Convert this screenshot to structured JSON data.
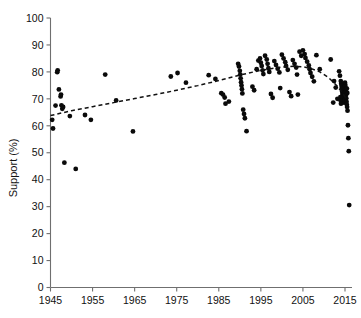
{
  "chart_data": {
    "type": "scatter",
    "title": "",
    "xlabel": "",
    "ylabel": "Support (%)",
    "xlim": [
      1945,
      2017
    ],
    "ylim": [
      0,
      100
    ],
    "grid": false,
    "legend": null,
    "xticks": [
      1945,
      1955,
      1965,
      1975,
      1985,
      1995,
      2005,
      2015
    ],
    "yticks": [
      0,
      10,
      20,
      30,
      40,
      50,
      60,
      70,
      80,
      90,
      100
    ],
    "series": [
      {
        "name": "Survey results",
        "type": "scatter",
        "marker": "filled-circle",
        "color": "#0a0a0a",
        "points": [
          [
            1945.4,
            62.2
          ],
          [
            1945.6,
            59.0
          ],
          [
            1946.2,
            67.5
          ],
          [
            1946.6,
            79.9
          ],
          [
            1946.7,
            80.6
          ],
          [
            1947.0,
            73.5
          ],
          [
            1947.4,
            70.9
          ],
          [
            1947.5,
            71.6
          ],
          [
            1947.6,
            67.6
          ],
          [
            1947.8,
            66.3
          ],
          [
            1948.0,
            67.0
          ],
          [
            1948.3,
            46.3
          ],
          [
            1949.6,
            63.6
          ],
          [
            1951.0,
            44.0
          ],
          [
            1953.2,
            64.0
          ],
          [
            1954.6,
            62.2
          ],
          [
            1958.0,
            79.0
          ],
          [
            1960.6,
            69.4
          ],
          [
            1964.6,
            57.9
          ],
          [
            1973.6,
            78.3
          ],
          [
            1975.2,
            79.6
          ],
          [
            1977.2,
            76.0
          ],
          [
            1982.6,
            78.8
          ],
          [
            1984.2,
            77.4
          ],
          [
            1985.6,
            72.1
          ],
          [
            1986.0,
            71.6
          ],
          [
            1986.4,
            70.5
          ],
          [
            1986.6,
            68.2
          ],
          [
            1987.4,
            69.0
          ],
          [
            1989.6,
            83.0
          ],
          [
            1989.8,
            82.0
          ],
          [
            1990.0,
            80.4
          ],
          [
            1990.1,
            79.0
          ],
          [
            1990.2,
            77.6
          ],
          [
            1990.3,
            76.2
          ],
          [
            1990.4,
            75.0
          ],
          [
            1990.5,
            73.6
          ],
          [
            1990.6,
            72.0
          ],
          [
            1990.8,
            66.0
          ],
          [
            1991.0,
            64.4
          ],
          [
            1991.2,
            62.8
          ],
          [
            1991.6,
            58.0
          ],
          [
            1993.0,
            74.5
          ],
          [
            1993.4,
            73.2
          ],
          [
            1994.0,
            81.0
          ],
          [
            1994.4,
            84.2
          ],
          [
            1994.8,
            85.0
          ],
          [
            1995.0,
            83.4
          ],
          [
            1995.2,
            82.2
          ],
          [
            1995.4,
            80.6
          ],
          [
            1995.6,
            79.2
          ],
          [
            1996.0,
            86.0
          ],
          [
            1996.4,
            84.6
          ],
          [
            1996.6,
            83.0
          ],
          [
            1996.8,
            81.4
          ],
          [
            1997.0,
            80.0
          ],
          [
            1997.4,
            71.8
          ],
          [
            1997.8,
            70.4
          ],
          [
            1998.2,
            84.0
          ],
          [
            1998.6,
            82.6
          ],
          [
            1999.0,
            81.2
          ],
          [
            1999.4,
            79.8
          ],
          [
            1999.6,
            74.0
          ],
          [
            2000.0,
            86.4
          ],
          [
            2000.4,
            85.0
          ],
          [
            2000.8,
            83.6
          ],
          [
            2001.0,
            82.2
          ],
          [
            2001.4,
            80.8
          ],
          [
            2001.8,
            72.5
          ],
          [
            2002.2,
            71.0
          ],
          [
            2002.6,
            84.4
          ],
          [
            2003.0,
            83.0
          ],
          [
            2003.4,
            81.6
          ],
          [
            2003.6,
            79.0
          ],
          [
            2003.8,
            71.6
          ],
          [
            2004.2,
            87.5
          ],
          [
            2004.6,
            86.0
          ],
          [
            2005.0,
            88.0
          ],
          [
            2005.4,
            86.6
          ],
          [
            2005.6,
            85.2
          ],
          [
            2006.0,
            83.8
          ],
          [
            2006.4,
            82.4
          ],
          [
            2006.6,
            81.0
          ],
          [
            2006.8,
            79.6
          ],
          [
            2007.2,
            78.2
          ],
          [
            2007.6,
            76.5
          ],
          [
            2008.2,
            86.2
          ],
          [
            2009.0,
            81.0
          ],
          [
            2011.6,
            84.6
          ],
          [
            2012.4,
            76.6
          ],
          [
            2012.8,
            74.2
          ],
          [
            2013.6,
            80.2
          ],
          [
            2013.8,
            78.6
          ],
          [
            2014.0,
            76.6
          ],
          [
            2014.1,
            75.6
          ],
          [
            2014.2,
            74.8
          ],
          [
            2014.25,
            74.0
          ],
          [
            2014.3,
            73.4
          ],
          [
            2014.35,
            72.8
          ],
          [
            2014.4,
            72.2
          ],
          [
            2014.45,
            71.6
          ],
          [
            2014.5,
            71.0
          ],
          [
            2014.55,
            70.4
          ],
          [
            2014.6,
            69.8
          ],
          [
            2014.65,
            69.2
          ],
          [
            2014.7,
            68.6
          ],
          [
            2014.75,
            73.0
          ],
          [
            2014.8,
            72.4
          ],
          [
            2014.85,
            71.8
          ],
          [
            2014.9,
            70.8
          ],
          [
            2014.95,
            69.6
          ],
          [
            2015.0,
            76.0
          ],
          [
            2015.05,
            75.2
          ],
          [
            2015.1,
            74.4
          ],
          [
            2015.15,
            73.6
          ],
          [
            2015.2,
            72.6
          ],
          [
            2015.25,
            71.4
          ],
          [
            2015.3,
            70.2
          ],
          [
            2015.35,
            69.0
          ],
          [
            2015.4,
            68.0
          ],
          [
            2015.5,
            67.0
          ],
          [
            2013.9,
            70.6
          ],
          [
            2013.95,
            69.4
          ],
          [
            2014.05,
            68.2
          ],
          [
            2015.45,
            73.8
          ],
          [
            2015.55,
            72.2
          ],
          [
            2015.6,
            65.6
          ],
          [
            2015.7,
            60.2
          ],
          [
            2015.8,
            55.4
          ],
          [
            2015.9,
            50.6
          ],
          [
            2016.0,
            30.6
          ],
          [
            2013.2,
            70.0
          ],
          [
            2012.2,
            68.6
          ]
        ]
      }
    ],
    "trend_line": {
      "name": "Fitted trend",
      "style": "dashed",
      "color": "#111111",
      "points": [
        [
          1945.0,
          63.8
        ],
        [
          1950.0,
          65.6
        ],
        [
          1955.0,
          67.1
        ],
        [
          1960.0,
          68.6
        ],
        [
          1965.0,
          70.1
        ],
        [
          1970.0,
          71.6
        ],
        [
          1975.0,
          73.2
        ],
        [
          1980.0,
          74.9
        ],
        [
          1985.0,
          76.8
        ],
        [
          1990.0,
          78.8
        ],
        [
          1995.0,
          80.6
        ],
        [
          2000.0,
          81.8
        ],
        [
          2003.0,
          82.1
        ],
        [
          2005.0,
          81.9
        ],
        [
          2007.0,
          81.2
        ],
        [
          2009.0,
          80.0
        ],
        [
          2011.0,
          78.0
        ],
        [
          2013.0,
          75.0
        ],
        [
          2014.5,
          72.0
        ],
        [
          2015.5,
          69.5
        ]
      ]
    }
  }
}
